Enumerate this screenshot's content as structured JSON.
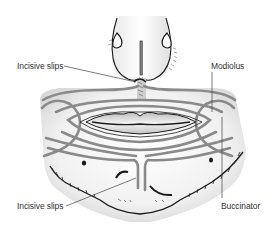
{
  "figure": {
    "colors": {
      "muscle_band": "#8a8a8a",
      "outline": "#1a1a1a",
      "skin_shading": "#e6e6e6",
      "background": "#ffffff",
      "leader_line": "#444444"
    }
  },
  "labels": {
    "incisive_slips_top": "Incisive slips",
    "modiolus": "Modiolus",
    "incisive_slips_bottom": "Incisive slips",
    "buccinator": "Buccinator"
  }
}
